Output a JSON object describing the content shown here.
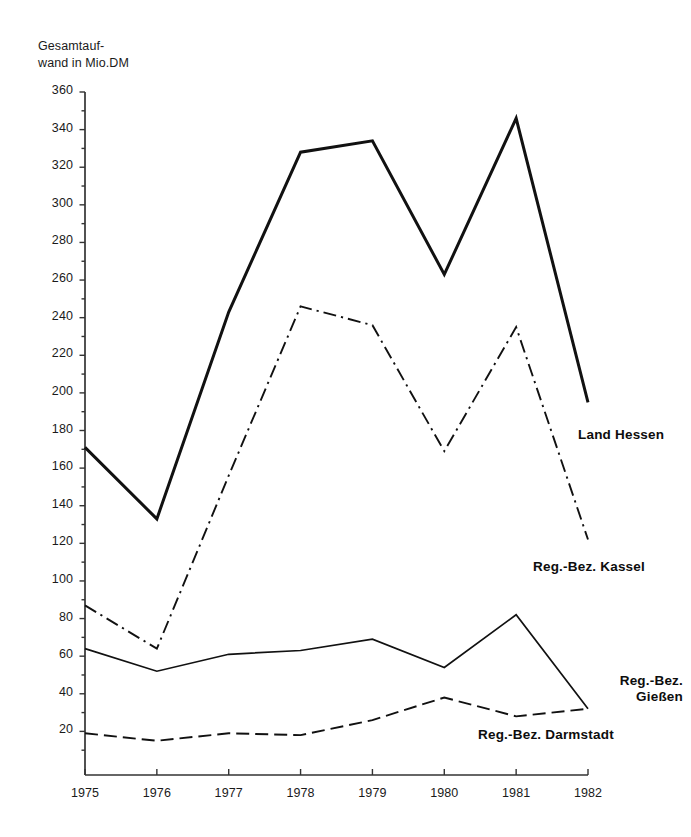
{
  "axis": {
    "y_title_line1": "Gesamtauf-",
    "y_title_line2": "wand in Mio.DM",
    "y_ticks": [
      "360",
      "340",
      "320",
      "300",
      "280",
      "260",
      "240",
      "220",
      "200",
      "180",
      "160",
      "140",
      "120",
      "100",
      "80",
      "60",
      "40",
      "20"
    ],
    "x_ticks": [
      "1975",
      "1976",
      "1977",
      "1978",
      "1979",
      "1980",
      "1981",
      "1982"
    ]
  },
  "labels": {
    "land_hessen": "Land Hessen",
    "kassel": "Reg.-Bez. Kassel",
    "giessen_line1": "Reg.-Bez.",
    "giessen_line2": "Gießen",
    "darmstadt": "Reg.-Bez. Darmstadt"
  },
  "colors": {
    "line": "#111111",
    "axis": "#333333",
    "background": "#ffffff"
  },
  "chart_data": {
    "type": "line",
    "title": "",
    "xlabel": "",
    "ylabel": "Gesamtaufwand in Mio.DM",
    "x": [
      1975,
      1976,
      1977,
      1978,
      1979,
      1980,
      1981,
      1982
    ],
    "categories": [
      "1975",
      "1976",
      "1977",
      "1978",
      "1979",
      "1980",
      "1981",
      "1982"
    ],
    "xlim": [
      1975,
      1982
    ],
    "ylim": [
      0,
      360
    ],
    "ytick_step": 20,
    "yminor_step": 10,
    "grid": false,
    "legend": "inline-right-labels",
    "series": [
      {
        "name": "Land Hessen",
        "style": "solid-thick",
        "values": [
          171,
          133,
          243,
          328,
          334,
          263,
          346,
          195
        ]
      },
      {
        "name": "Reg.-Bez. Kassel",
        "style": "dash-dot",
        "values": [
          87,
          64,
          156,
          246,
          236,
          169,
          235,
          122
        ]
      },
      {
        "name": "Reg.-Bez. Gießen",
        "style": "solid-thin",
        "values": [
          64,
          52,
          61,
          63,
          69,
          54,
          82,
          32
        ]
      },
      {
        "name": "Reg.-Bez. Darmstadt",
        "style": "dashed",
        "values": [
          19,
          15,
          19,
          18,
          26,
          38,
          28,
          32
        ]
      }
    ]
  }
}
